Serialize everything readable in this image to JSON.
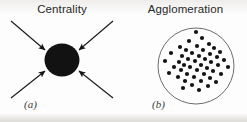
{
  "figure": {
    "width": 247,
    "height": 122,
    "background_color": "#fdfdfd",
    "ink_color": "#1a1a1a",
    "outline_color": "#55575a"
  },
  "panels": [
    {
      "key": "centrality",
      "title": "Centrality",
      "label": "(a)",
      "icon": "converging-arrows-to-core",
      "core": {
        "shape": "filled-blob",
        "cx": 62,
        "cy": 60,
        "rx": 17.5,
        "ry": 16.5,
        "fill": "#121212"
      },
      "arrows": [
        {
          "name": "arrow-top-left",
          "x1": 11,
          "y1": 21,
          "x2": 45,
          "y2": 50
        },
        {
          "name": "arrow-top-right",
          "x1": 113,
          "y1": 21,
          "x2": 79,
          "y2": 50
        },
        {
          "name": "arrow-bottom-left",
          "x1": 11,
          "y1": 98,
          "x2": 45,
          "y2": 71
        },
        {
          "name": "arrow-bottom-right",
          "x1": 113,
          "y1": 98,
          "x2": 79,
          "y2": 71
        }
      ]
    },
    {
      "key": "agglomeration",
      "title": "Agglomeration",
      "label": "(b)",
      "icon": "dot-cluster-in-circle",
      "boundary": {
        "shape": "circle-outline",
        "cx": 72,
        "cy": 66,
        "r": 38,
        "stroke": "#6a6c6f",
        "stroke_width": 1
      },
      "dot": {
        "r": 2.1,
        "fill": "#141414",
        "count": 47
      },
      "dots": [
        [
          72,
          32
        ],
        [
          78,
          38
        ],
        [
          65,
          41
        ],
        [
          85,
          44
        ],
        [
          56,
          47
        ],
        [
          73,
          46
        ],
        [
          90,
          48
        ],
        [
          62,
          50
        ],
        [
          79,
          50
        ],
        [
          96,
          52
        ],
        [
          47,
          53
        ],
        [
          68,
          53
        ],
        [
          86,
          54
        ],
        [
          58,
          56
        ],
        [
          75,
          56
        ],
        [
          93,
          57
        ],
        [
          64,
          59
        ],
        [
          81,
          59
        ],
        [
          100,
          60
        ],
        [
          41,
          61
        ],
        [
          55,
          62
        ],
        [
          71,
          61
        ],
        [
          87,
          62
        ],
        [
          60,
          65
        ],
        [
          77,
          65
        ],
        [
          94,
          65
        ],
        [
          50,
          67
        ],
        [
          66,
          67
        ],
        [
          83,
          68
        ],
        [
          104,
          67
        ],
        [
          57,
          70
        ],
        [
          73,
          70
        ],
        [
          89,
          71
        ],
        [
          45,
          73
        ],
        [
          63,
          74
        ],
        [
          80,
          74
        ],
        [
          97,
          74
        ],
        [
          54,
          77
        ],
        [
          70,
          77
        ],
        [
          86,
          78
        ],
        [
          61,
          81
        ],
        [
          77,
          81
        ],
        [
          92,
          82
        ],
        [
          68,
          85
        ],
        [
          84,
          86
        ],
        [
          59,
          88
        ],
        [
          75,
          90
        ]
      ]
    }
  ]
}
